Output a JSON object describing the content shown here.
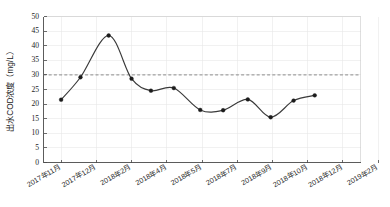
{
  "chart_data": {
    "type": "line",
    "title": "",
    "xlabel": "",
    "ylabel": "出水COD浓度（mg/L）",
    "ylim": [
      0,
      50
    ],
    "ytick_step": 5,
    "yticks": [
      0,
      5,
      10,
      15,
      20,
      25,
      30,
      35,
      40,
      45,
      50
    ],
    "ytick_labels": [
      "0",
      "5",
      "10",
      "15",
      "20",
      "25",
      "30",
      "35",
      "40",
      "45",
      "50"
    ],
    "grid": true,
    "legend": "none",
    "categories": [
      "2017年11月",
      "2017年12月",
      "2018年2月",
      "2018年4月",
      "2018年5月",
      "2018年7月",
      "2018年9月",
      "2018年10月",
      "2018年12月",
      "2019年2月"
    ],
    "xtick_labels": [
      "2017年11月",
      "2017年12月",
      "2018年2月",
      "2018年4月",
      "2018年5月",
      "2018年7月",
      "2018年9月",
      "2018年10月",
      "2018年12月",
      "2019年2月"
    ],
    "series": [
      {
        "name": "出水COD浓度",
        "marker": "filled-circle",
        "color": "#2b2b2b",
        "x": [
          1.0,
          1.55,
          2.35,
          3.0,
          3.55,
          4.2,
          4.95,
          5.6,
          6.3,
          6.95,
          7.6,
          8.2
        ],
        "values": [
          21.5,
          29.2,
          43.5,
          28.7,
          24.6,
          25.5,
          18.0,
          17.9,
          21.6,
          15.5,
          21.2,
          23.0
        ]
      }
    ],
    "annotations": [
      {
        "type": "horizontal-threshold-line",
        "value": 30,
        "style": "dashed",
        "color": "#7a7a7a",
        "label": ""
      }
    ]
  },
  "figure": {
    "background_color": "#ffffff",
    "axis_color": "#4a4a4a",
    "grid_color": "#e8e8e8",
    "series_color": "#2b2b2b",
    "threshold_color": "#7a7a7a"
  }
}
